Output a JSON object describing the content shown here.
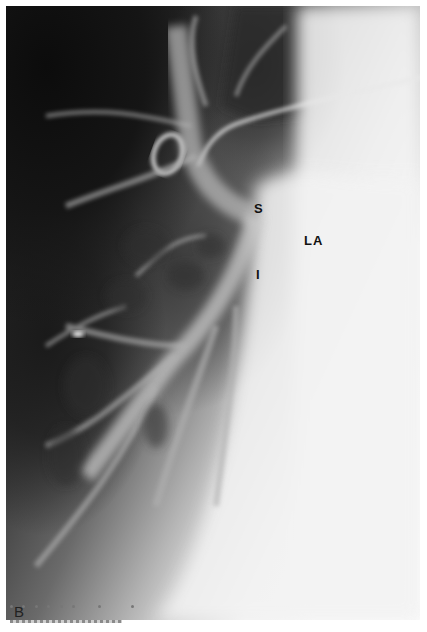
{
  "figure": {
    "type": "angiogram-radiograph",
    "panel_label": "B",
    "annotations": [
      {
        "id": "S",
        "text": "S",
        "x": 254,
        "y": 201
      },
      {
        "id": "LA",
        "text": "LA",
        "x": 305,
        "y": 233
      },
      {
        "id": "I",
        "text": "I",
        "x": 254,
        "y": 267
      }
    ],
    "colors": {
      "dark": "#101010",
      "mid": "#6a6a6a",
      "light": "#f7f7f7",
      "label": "#111111"
    }
  }
}
